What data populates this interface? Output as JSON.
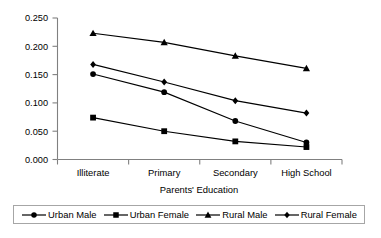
{
  "chart_data": {
    "type": "line",
    "title": "",
    "xlabel": "Parents' Education",
    "ylabel": "",
    "categories": [
      "Illiterate",
      "Primary",
      "Secondary",
      "High School"
    ],
    "ylim": [
      0.0,
      0.25
    ],
    "yticks": [
      "0.000",
      "0.050",
      "0.100",
      "0.150",
      "0.200",
      "0.250"
    ],
    "ytick_values": [
      0.0,
      0.05,
      0.1,
      0.15,
      0.2,
      0.25
    ],
    "grid": false,
    "legend_position": "bottom",
    "series": [
      {
        "name": "Urban Male",
        "marker": "circle",
        "color": "#000000",
        "values": [
          0.151,
          0.119,
          0.068,
          0.03
        ]
      },
      {
        "name": "Urban Female",
        "marker": "square",
        "color": "#000000",
        "values": [
          0.074,
          0.05,
          0.032,
          0.022
        ]
      },
      {
        "name": "Rural Male",
        "marker": "triangle",
        "color": "#000000",
        "values": [
          0.223,
          0.207,
          0.183,
          0.161
        ]
      },
      {
        "name": "Rural Female",
        "marker": "diamond",
        "color": "#000000",
        "values": [
          0.168,
          0.137,
          0.104,
          0.082
        ]
      }
    ]
  },
  "legend": {
    "items": [
      {
        "label": "Urban Male",
        "marker": "circle"
      },
      {
        "label": "Urban Female",
        "marker": "square"
      },
      {
        "label": "Rural Male",
        "marker": "triangle"
      },
      {
        "label": "Rural Female",
        "marker": "diamond"
      }
    ]
  }
}
